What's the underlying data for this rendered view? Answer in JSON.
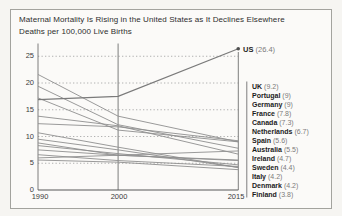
{
  "card": {
    "title": "Maternal Mortality Is Rising in the United States as It Declines Elsewhere",
    "subtitle": "Deaths per 100,000 Live Births"
  },
  "chart_data": {
    "type": "line",
    "title": "Maternal Mortality Is Rising in the United States as It Declines Elsewhere",
    "subtitle": "Deaths per 100,000 Live Births",
    "xlabel": "",
    "ylabel": "Deaths per 100,000 Live Births",
    "x": [
      1990,
      2000,
      2015
    ],
    "x_tick_labels": [
      "1990",
      "2000",
      "2015"
    ],
    "y_ticks": [
      0,
      5,
      10,
      15,
      20,
      25
    ],
    "y_tick_labels": [
      "0",
      "5",
      "10",
      "15",
      "20",
      "25"
    ],
    "ylim": [
      0,
      27.5
    ],
    "grid": "horizontal-dotted",
    "legend_position": "right",
    "series": [
      {
        "name": "US",
        "value_label": "(26.4)",
        "values": [
          16.9,
          17.5,
          26.4
        ],
        "marker_end": true
      },
      {
        "name": "UK",
        "value_label": "(9.2)",
        "values": [
          12.4,
          11.8,
          9.2
        ]
      },
      {
        "name": "Portugal",
        "value_label": "(9)",
        "values": [
          21.6,
          13.8,
          9.0
        ]
      },
      {
        "name": "Germany",
        "value_label": "(9)",
        "values": [
          17.2,
          11.2,
          9.0
        ]
      },
      {
        "name": "France",
        "value_label": "(7.8)",
        "values": [
          19.4,
          12.2,
          7.8
        ]
      },
      {
        "name": "Canada",
        "value_label": "(7.3)",
        "values": [
          6.0,
          6.5,
          7.3
        ]
      },
      {
        "name": "Netherlands",
        "value_label": "(6.7)",
        "values": [
          13.8,
          12.0,
          6.7
        ]
      },
      {
        "name": "Spain",
        "value_label": "(5.6)",
        "values": [
          8.8,
          6.5,
          5.6
        ]
      },
      {
        "name": "Australia",
        "value_label": "(5.5)",
        "values": [
          7.5,
          6.5,
          5.5
        ]
      },
      {
        "name": "Ireland",
        "value_label": "(4.7)",
        "values": [
          8.3,
          6.8,
          4.7
        ]
      },
      {
        "name": "Sweden",
        "value_label": "(4.4)",
        "values": [
          6.6,
          5.5,
          4.4
        ]
      },
      {
        "name": "Italy",
        "value_label": "(4.2)",
        "values": [
          10.7,
          8.0,
          4.2
        ]
      },
      {
        "name": "Denmark",
        "value_label": "(4.2)",
        "values": [
          9.5,
          7.5,
          4.2
        ]
      },
      {
        "name": "Finland",
        "value_label": "(3.8)",
        "values": [
          5.6,
          5.2,
          3.8
        ]
      }
    ]
  }
}
